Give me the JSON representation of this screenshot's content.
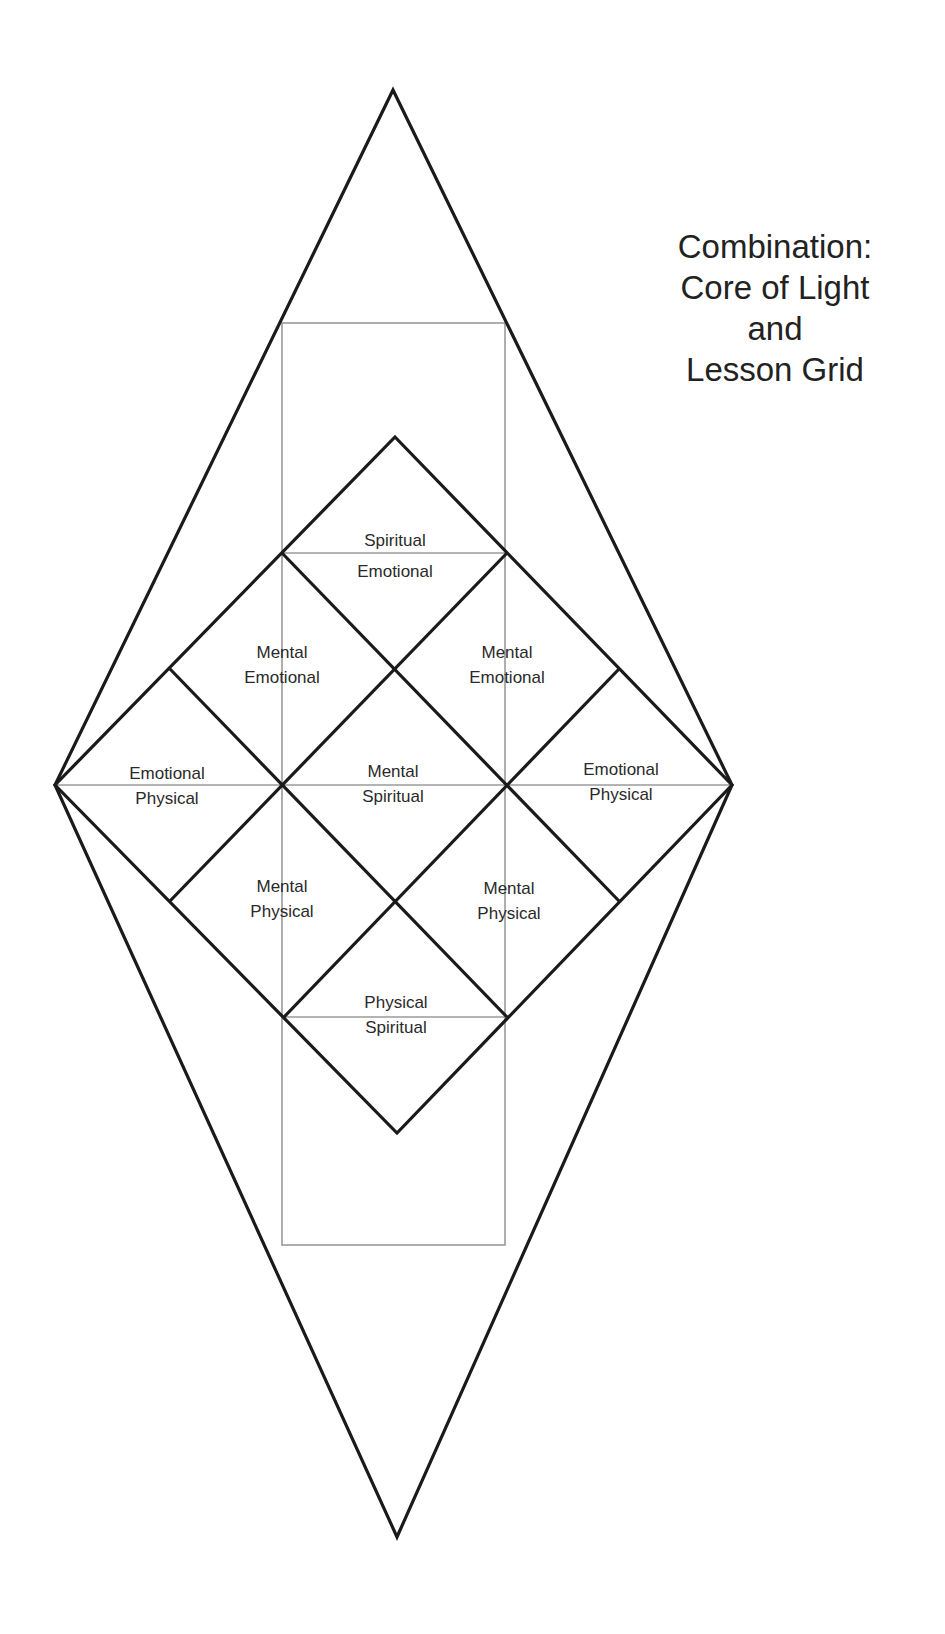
{
  "title": {
    "lines": [
      "Combination:",
      "Core of Light",
      "and",
      "Lesson Grid"
    ]
  },
  "colors": {
    "line": "#1a1a1a",
    "guide": "#9a9a9a",
    "text": "#2a2a2a",
    "background": "#ffffff"
  },
  "cells": [
    {
      "id": "top",
      "line1": "Spiritual",
      "line2": "Emotional"
    },
    {
      "id": "upper-left",
      "line1": "Mental",
      "line2": "Emotional"
    },
    {
      "id": "upper-right",
      "line1": "Mental",
      "line2": "Emotional"
    },
    {
      "id": "left",
      "line1": "Emotional",
      "line2": "Physical"
    },
    {
      "id": "center",
      "line1": "Mental",
      "line2": "Spiritual"
    },
    {
      "id": "right",
      "line1": "Emotional",
      "line2": "Physical"
    },
    {
      "id": "lower-left",
      "line1": "Mental",
      "line2": "Physical"
    },
    {
      "id": "lower-right",
      "line1": "Mental",
      "line2": "Physical"
    },
    {
      "id": "bottom",
      "line1": "Physical",
      "line2": "Spiritual"
    }
  ]
}
